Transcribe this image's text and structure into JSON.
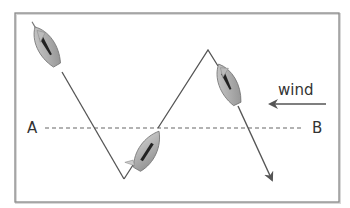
{
  "diagram": {
    "labels": {
      "point_a": "A",
      "point_b": "B",
      "wind": "wind"
    },
    "colors": {
      "frame": "#8a8a8a",
      "path": "#555555",
      "dashed_line": "#666666",
      "boat_hull": "#a8a8a8",
      "boat_sail": "#222222",
      "wind_arrow": "#555555",
      "text": "#333333"
    },
    "elements": [
      {
        "name": "frame",
        "type": "rectangle"
      },
      {
        "name": "course-path",
        "type": "zigzag-line",
        "ends_with": "arrowhead"
      },
      {
        "name": "boat",
        "count": 3
      },
      {
        "name": "reference-line-a-b",
        "type": "dashed-line"
      },
      {
        "name": "wind-arrow",
        "direction": "left"
      }
    ]
  }
}
